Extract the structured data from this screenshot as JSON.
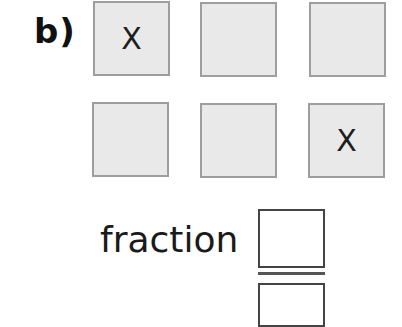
{
  "question": {
    "label": "b)",
    "grid": {
      "rows": 2,
      "cols": 3,
      "cells": [
        {
          "row": 0,
          "col": 0,
          "mark": "X"
        },
        {
          "row": 0,
          "col": 1,
          "mark": ""
        },
        {
          "row": 0,
          "col": 2,
          "mark": ""
        },
        {
          "row": 1,
          "col": 0,
          "mark": ""
        },
        {
          "row": 1,
          "col": 1,
          "mark": ""
        },
        {
          "row": 1,
          "col": 2,
          "mark": "X"
        }
      ]
    },
    "fraction": {
      "word": "fraction",
      "numerator": "",
      "denominator": ""
    }
  },
  "colors": {
    "cell_fill": "#e9e9e9",
    "cell_border": "#9e9e9e",
    "text": "#1a1a1a"
  }
}
